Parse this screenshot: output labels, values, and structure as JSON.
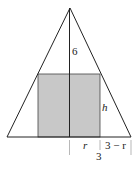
{
  "diagram": {
    "labels": {
      "height": "6",
      "cyl_height": "h",
      "radius": "r",
      "remainder": "3 − r",
      "base_half": "3"
    },
    "colors": {
      "stroke": "#222222",
      "rect_fill": "#c8c8c8",
      "background": "#ffffff"
    }
  }
}
